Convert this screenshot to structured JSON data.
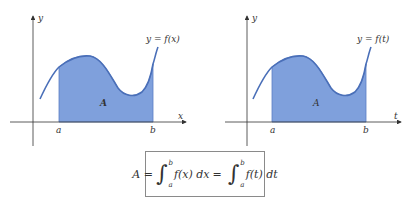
{
  "colors": {
    "area_fill": "#7FA0DC",
    "area_edge": "#5B7FC4",
    "curve": "#4A6FB8",
    "axis": "#333333",
    "text": "#333333"
  },
  "figures": [
    {
      "id": "left",
      "y_axis_label": "y",
      "x_axis_label": "x",
      "curve_label": "y = f(x)",
      "area_label": "A",
      "lower_limit_label": "a",
      "upper_limit_label": "b"
    },
    {
      "id": "right",
      "y_axis_label": "y",
      "x_axis_label": "t",
      "curve_label": "y = f(t)",
      "area_label": "A",
      "lower_limit_label": "a",
      "upper_limit_label": "b"
    }
  ],
  "formula": {
    "lhs": "A =",
    "integral1": {
      "lower": "a",
      "upper": "b",
      "integrand": "f(x) dx"
    },
    "equals": "=",
    "integral2": {
      "lower": "a",
      "upper": "b",
      "integrand": "f(t) dt"
    },
    "text": "A = ∫_a^b f(x) dx = ∫_a^b f(t) dt"
  }
}
